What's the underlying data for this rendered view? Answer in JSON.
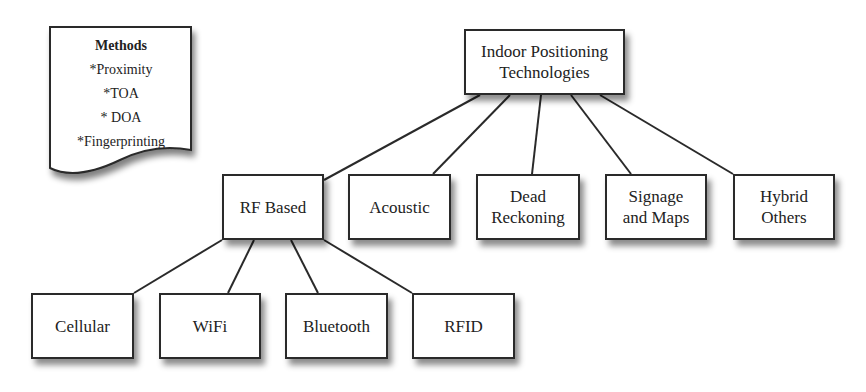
{
  "methods_note": {
    "title": "Methods",
    "items": [
      "*Proximity",
      "*TOA",
      "* DOA",
      "*Fingerprinting"
    ]
  },
  "root": {
    "line1": "Indoor Positioning",
    "line2": "Technologies"
  },
  "categories": [
    {
      "line1": "RF Based",
      "line2": ""
    },
    {
      "line1": "Acoustic",
      "line2": ""
    },
    {
      "line1": "Dead",
      "line2": "Reckoning"
    },
    {
      "line1": "Signage",
      "line2": "and Maps"
    },
    {
      "line1": "Hybrid",
      "line2": "Others"
    }
  ],
  "rf_children": [
    {
      "label": "Cellular"
    },
    {
      "label": "WiFi"
    },
    {
      "label": "Bluetooth"
    },
    {
      "label": "RFID"
    }
  ],
  "colors": {
    "stroke": "#2a2a2a",
    "background": "#ffffff",
    "text": "#222222"
  }
}
